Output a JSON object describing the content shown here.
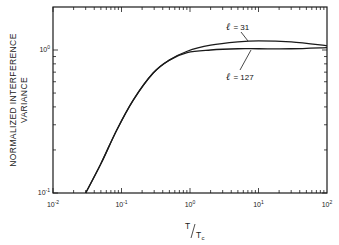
{
  "chart_data": {
    "type": "line",
    "title": "",
    "xlabel": "T/Tc",
    "xlabel_main": "T",
    "xlabel_sub": "c",
    "ylabel": "NORMALIZED INTERFERENCE VARIANCE",
    "ylabel_line1": "NORMALIZED  INTERFERENCE",
    "ylabel_line2": "VARIANCE",
    "xscale": "log",
    "yscale": "log",
    "xlim": [
      0.01,
      100
    ],
    "ylim": [
      0.1,
      2.0
    ],
    "grid": false,
    "legend": "none (inline annotations)",
    "x_ticks": [
      {
        "value": 0.01,
        "base": "10",
        "exp": "-2"
      },
      {
        "value": 0.1,
        "base": "10",
        "exp": "-1"
      },
      {
        "value": 1,
        "base": "10",
        "exp": "0"
      },
      {
        "value": 10,
        "base": "10",
        "exp": "1"
      },
      {
        "value": 100,
        "base": "10",
        "exp": "2"
      }
    ],
    "y_ticks": [
      {
        "value": 0.1,
        "base": "10",
        "exp": "-1"
      },
      {
        "value": 1,
        "base": "10",
        "exp": "0"
      }
    ],
    "series": [
      {
        "name": "l = 31",
        "label_symbol": "ℓ",
        "label_value": "= 31",
        "x": [
          0.03,
          0.05,
          0.085,
          0.15,
          0.29,
          0.5,
          0.91,
          2,
          5,
          10,
          30,
          100
        ],
        "values": [
          0.1,
          0.16,
          0.275,
          0.45,
          0.69,
          0.85,
          0.98,
          1.08,
          1.14,
          1.16,
          1.14,
          1.07
        ]
      },
      {
        "name": "l = 127",
        "label_symbol": "ℓ",
        "label_value": "= 127",
        "x": [
          0.03,
          0.05,
          0.085,
          0.15,
          0.29,
          0.5,
          0.91,
          2,
          5,
          10,
          30,
          100
        ],
        "values": [
          0.1,
          0.16,
          0.275,
          0.45,
          0.69,
          0.85,
          0.96,
          1.0,
          1.02,
          1.02,
          1.02,
          1.04
        ]
      }
    ]
  },
  "annotations": {
    "l31": {
      "symbol": "ℓ",
      "text": "= 31"
    },
    "l127": {
      "symbol": "ℓ",
      "text": "= 127"
    }
  },
  "colors": {
    "line": "#1a1a1a",
    "background": "#ffffff"
  }
}
